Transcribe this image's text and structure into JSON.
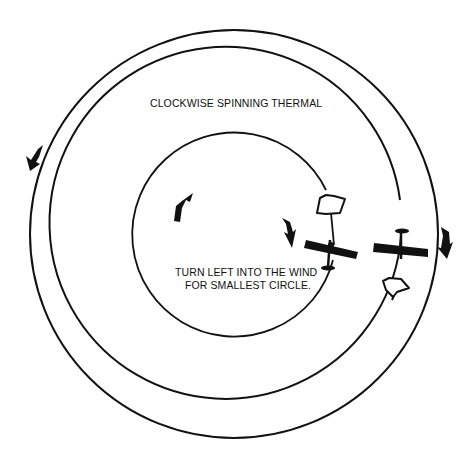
{
  "diagram": {
    "title_label": "CLOCKWISE SPINNING THERMAL",
    "note_line1": "TURN LEFT INTO THE WIND",
    "note_line2": "FOR SMALLEST CIRCLE.",
    "colors": {
      "ink": "#111111",
      "background": "#ffffff"
    },
    "elements": {
      "circles": [
        "outer-path-circle",
        "middle-path-circle",
        "inner-path-circle"
      ],
      "rotation_arrows": [
        "left-outer-arrow",
        "inner-left-arrow",
        "inner-right-arrow",
        "outer-right-arrow"
      ],
      "wind_arrows": [
        "upper-wind-arrow",
        "lower-wind-arrow"
      ],
      "aircraft": [
        "inner-glider",
        "outer-glider"
      ]
    }
  }
}
